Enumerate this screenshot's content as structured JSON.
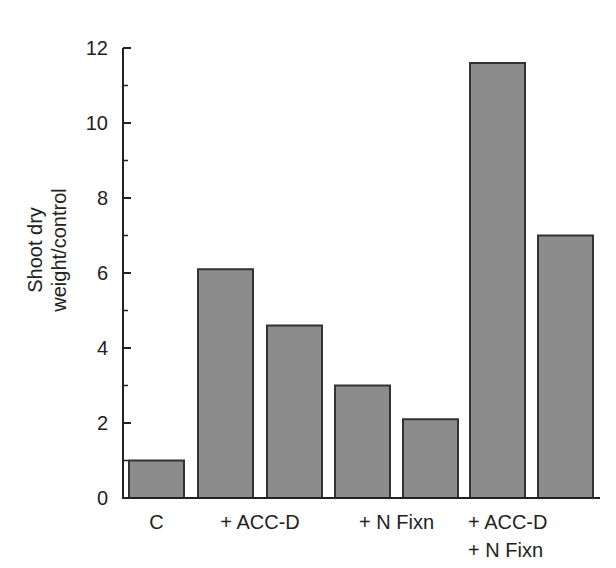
{
  "chart_data": {
    "type": "bar",
    "title": "",
    "xlabel": "",
    "ylabel": "Shoot dry weight/control",
    "ylabel_lines": [
      "Shoot dry",
      "weight/control"
    ],
    "ylim": [
      0,
      12
    ],
    "yticks": [
      0,
      2,
      4,
      6,
      8,
      10,
      12
    ],
    "minor_ticks": [
      1,
      3,
      5,
      7,
      9,
      11
    ],
    "grid": false,
    "legend": null,
    "bar_color": "#8c8c8c",
    "bar_edge_color": "#333333",
    "groups": [
      {
        "label_lines": [
          "C"
        ],
        "bars": [
          0
        ]
      },
      {
        "label_lines": [
          "+ ACC-D"
        ],
        "bars": [
          1,
          2
        ]
      },
      {
        "label_lines": [
          "+ N Fixn"
        ],
        "bars": [
          3,
          4
        ]
      },
      {
        "label_lines": [
          "+ ACC-D",
          "+ N Fixn"
        ],
        "bars": [
          5,
          6
        ]
      }
    ],
    "categories": [
      "C",
      "+ ACC-D",
      "+ ACC-D",
      "+ N Fixn",
      "+ N Fixn",
      "+ ACC-D + N Fixn",
      "+ ACC-D + N Fixn"
    ],
    "values": [
      1.0,
      6.1,
      4.6,
      3.0,
      2.1,
      11.6,
      7.0
    ]
  }
}
